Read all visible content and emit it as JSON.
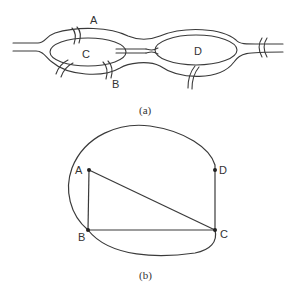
{
  "figure_a": {
    "caption": "(a)",
    "labels": {
      "A": "A",
      "B": "B",
      "C": "C",
      "D": "D"
    },
    "description": "River with two islands (C and D) and seven bridges (Königsberg bridges)"
  },
  "figure_b": {
    "caption": "(b)",
    "nodes": [
      {
        "id": "A",
        "label": "A"
      },
      {
        "id": "B",
        "label": "B"
      },
      {
        "id": "C",
        "label": "C"
      },
      {
        "id": "D",
        "label": "D"
      }
    ],
    "edges": [
      [
        "A",
        "B"
      ],
      [
        "A",
        "C"
      ],
      [
        "B",
        "C"
      ],
      [
        "C",
        "D"
      ],
      [
        "B",
        "D",
        "curve"
      ],
      [
        "B",
        "C",
        "curve"
      ]
    ]
  }
}
